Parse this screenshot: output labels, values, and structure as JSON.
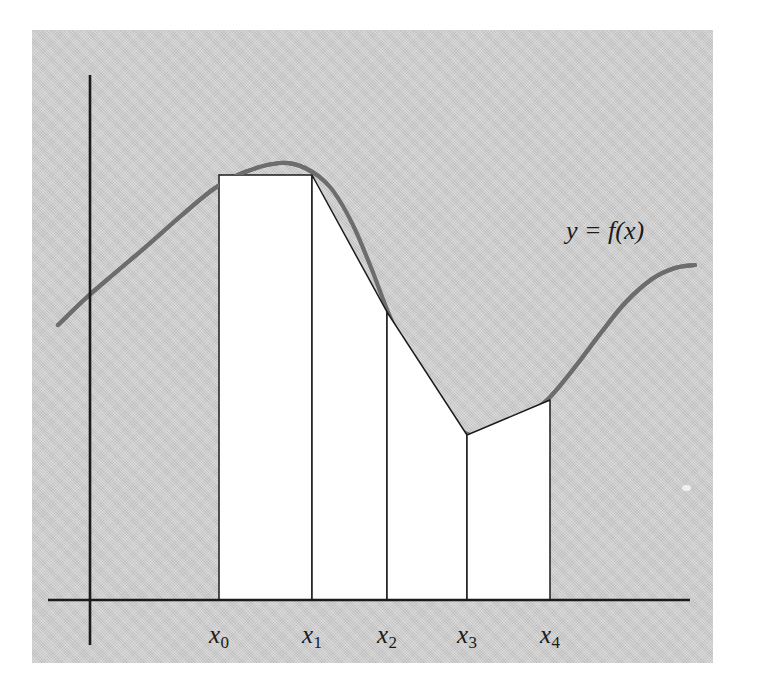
{
  "figure": {
    "kind": "trapezoidal-rule-diagram",
    "background_color": "#ffffff",
    "panel_color": "#c9c9c9",
    "panel": {
      "x": 32,
      "y": 30,
      "width": 681,
      "height": 633
    },
    "curve_label": "y = f(x)",
    "curve_label_pos": {
      "x": 566,
      "y": 218
    },
    "curve_color": "#6d6d6d",
    "line_color": "#1b1b1b",
    "trapezoid_fill": "#ffffff"
  },
  "axes": {
    "x_axis": {
      "y": 600,
      "x_start": 48,
      "x_end": 690
    },
    "y_axis": {
      "x": 90,
      "y_start": 75,
      "y_end": 645
    },
    "tick_label_y": 622
  },
  "chart_data": {
    "type": "area",
    "title": "",
    "subtitle": "",
    "xlabel": "",
    "ylabel": "",
    "grid": false,
    "legend": null,
    "annotations": [
      {
        "text": "y = f(x)",
        "x": 600,
        "y": 232
      }
    ],
    "tick_labels": [
      {
        "text": "x",
        "sub": "0"
      },
      {
        "text": "x",
        "sub": "1"
      },
      {
        "text": "x",
        "sub": "2"
      },
      {
        "text": "x",
        "sub": "3"
      },
      {
        "text": "x",
        "sub": "4"
      }
    ],
    "partition_x_px": [
      219,
      312,
      387,
      467,
      550
    ],
    "partition_top_y_px": [
      175,
      175,
      312,
      435,
      400
    ],
    "baseline_y_px": 600,
    "curve_points_px": [
      [
        58,
        325
      ],
      [
        85,
        299
      ],
      [
        115,
        273
      ],
      [
        148,
        245
      ],
      [
        182,
        215
      ],
      [
        215,
        188
      ],
      [
        245,
        172
      ],
      [
        280,
        163
      ],
      [
        305,
        168
      ],
      [
        330,
        187
      ],
      [
        352,
        223
      ],
      [
        372,
        270
      ],
      [
        388,
        312
      ],
      [
        408,
        356
      ],
      [
        428,
        392
      ],
      [
        447,
        419
      ],
      [
        467,
        434
      ],
      [
        487,
        437
      ],
      [
        508,
        430
      ],
      [
        530,
        414
      ],
      [
        551,
        396
      ],
      [
        575,
        367
      ],
      [
        600,
        334
      ],
      [
        625,
        303
      ],
      [
        652,
        279
      ],
      [
        675,
        268
      ],
      [
        695,
        265
      ]
    ],
    "trapezoids": [
      {
        "index": 1,
        "x_left_px": 219,
        "x_right_px": 312,
        "y_left_px": 175,
        "y_right_px": 175
      },
      {
        "index": 2,
        "x_left_px": 312,
        "x_right_px": 387,
        "y_left_px": 175,
        "y_right_px": 312
      },
      {
        "index": 3,
        "x_left_px": 387,
        "x_right_px": 467,
        "y_left_px": 312,
        "y_right_px": 435
      },
      {
        "index": 4,
        "x_left_px": 467,
        "x_right_px": 550,
        "y_left_px": 435,
        "y_right_px": 400
      }
    ]
  }
}
